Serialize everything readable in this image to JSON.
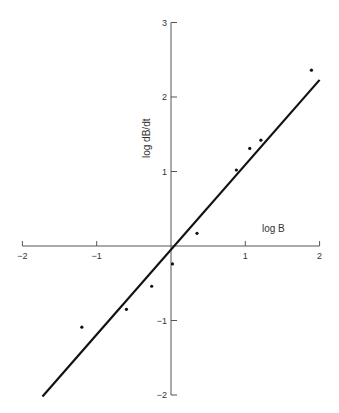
{
  "chart_data": {
    "type": "scatter",
    "title": "",
    "xlabel": "log B",
    "ylabel": "log dB/dt",
    "xlim": [
      -2,
      2
    ],
    "ylim": [
      -2,
      3
    ],
    "x_ticks": [
      "-2",
      "-1",
      "1",
      "2"
    ],
    "y_ticks": [
      "3",
      "2",
      "1",
      "-1",
      "-2"
    ],
    "grid": false,
    "legend": null,
    "points": [
      {
        "x": -1.2,
        "y": -1.09
      },
      {
        "x": -0.6,
        "y": -0.85
      },
      {
        "x": -0.26,
        "y": -0.54
      },
      {
        "x": 0.02,
        "y": -0.24
      },
      {
        "x": 0.35,
        "y": 0.17
      },
      {
        "x": 0.88,
        "y": 1.02
      },
      {
        "x": 1.06,
        "y": 1.31
      },
      {
        "x": 1.21,
        "y": 1.42
      },
      {
        "x": 1.89,
        "y": 2.36
      }
    ],
    "fit_line": {
      "x": [
        -1.73,
        2.0
      ],
      "y": [
        -2.02,
        2.23
      ],
      "slope": 1.13,
      "intercept": 0.0
    }
  },
  "colors": {
    "axis": "#555555",
    "data": "#111111",
    "line": "#111111"
  }
}
